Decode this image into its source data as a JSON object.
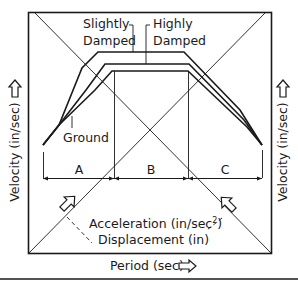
{
  "diagram": {
    "title": "",
    "curve_labels": {
      "slightly_damped_line1": "Slightly",
      "slightly_damped_line2": "Damped",
      "highly_damped_line1": "Highly",
      "highly_damped_line2": "Damped",
      "ground": "Ground"
    },
    "regions": [
      "A",
      "B",
      "C"
    ],
    "axes": {
      "left": "Velocity (in/sec)",
      "right": "Velocity (in/sec)",
      "bottom": "Period (sec)",
      "diagonal_1": "Acceleration (in/sec",
      "diagonal_1_superscript": "2",
      "diagonal_1_close": ")",
      "diagonal_2": "Displacement (in)"
    },
    "colors": {
      "line": "#1a1a1a",
      "background": "#ffffff"
    }
  }
}
